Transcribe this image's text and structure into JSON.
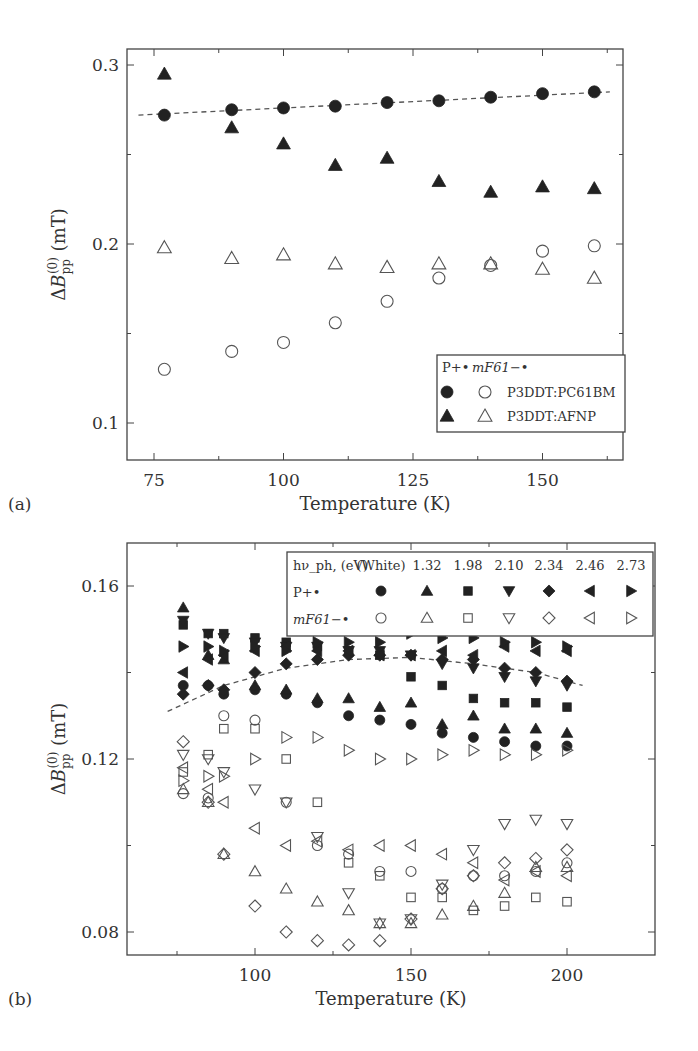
{
  "chart_data": [
    {
      "panel_label": "(a)",
      "type": "scatter",
      "xlabel": "Temperature (K)",
      "ylabel": "ΔB_pp^(0) (mT)",
      "xlim": [
        70,
        165
      ],
      "ylim": [
        0.08,
        0.31
      ],
      "xticks": [
        75,
        100,
        125,
        150
      ],
      "yticks": [
        0.1,
        0.2,
        0.3
      ],
      "grid": false,
      "legend": {
        "position": "lower right",
        "header": [
          "P+•",
          "mF61−•"
        ],
        "entries": [
          {
            "label": "P3DDT:PC61BM",
            "filled": "circle",
            "open": "circle"
          },
          {
            "label": "P3DDT:AFNP",
            "filled": "triangle-up",
            "open": "triangle-up"
          }
        ]
      },
      "fit_line": {
        "style": "dashed",
        "series": "P3DDT:PC61BM P+•",
        "x": [
          72,
          163
        ],
        "y": [
          0.272,
          0.285
        ]
      },
      "series": [
        {
          "name": "P3DDT:PC61BM P+•",
          "marker": "circle",
          "filled": true,
          "x": [
            77,
            90,
            100,
            110,
            120,
            130,
            140,
            150,
            160
          ],
          "y": [
            0.272,
            0.275,
            0.276,
            0.277,
            0.279,
            0.28,
            0.282,
            0.284,
            0.285
          ]
        },
        {
          "name": "P3DDT:PC61BM mF61−•",
          "marker": "circle",
          "filled": false,
          "x": [
            77,
            90,
            100,
            110,
            120,
            130,
            140,
            150,
            160
          ],
          "y": [
            0.13,
            0.14,
            0.145,
            0.156,
            0.168,
            0.181,
            0.188,
            0.196,
            0.199
          ]
        },
        {
          "name": "P3DDT:AFNP P+•",
          "marker": "triangle-up",
          "filled": true,
          "x": [
            77,
            90,
            100,
            110,
            120,
            130,
            140,
            150,
            160
          ],
          "y": [
            0.295,
            0.265,
            0.256,
            0.244,
            0.248,
            0.235,
            0.229,
            0.232,
            0.231
          ]
        },
        {
          "name": "P3DDT:AFNP mF61−•",
          "marker": "triangle-up",
          "filled": false,
          "x": [
            77,
            90,
            100,
            110,
            120,
            130,
            140,
            150,
            160
          ],
          "y": [
            0.198,
            0.192,
            0.194,
            0.189,
            0.187,
            0.189,
            0.189,
            0.186,
            0.181
          ]
        }
      ]
    },
    {
      "panel_label": "(b)",
      "type": "scatter",
      "xlabel": "Temperature (K)",
      "ylabel": "ΔB_pp^(0) (mT)",
      "xlim": [
        65,
        210
      ],
      "ylim": [
        0.075,
        0.166
      ],
      "xticks": [
        100,
        150,
        200
      ],
      "yticks": [
        0.08,
        0.12,
        0.16
      ],
      "grid": false,
      "legend": {
        "position": "upper right",
        "header_label": "hν_ph, (eV)",
        "columns": [
          "(White)",
          "1.32",
          "1.98",
          "2.10",
          "2.34",
          "2.46",
          "2.73"
        ],
        "row_labels": [
          "P+•",
          "mF61−•"
        ],
        "markers": [
          "circle",
          "triangle-up",
          "square",
          "triangle-down",
          "diamond",
          "triangle-left",
          "triangle-right"
        ]
      },
      "fit_line": {
        "style": "dashed",
        "x": [
          72,
          90,
          110,
          130,
          150,
          170,
          190,
          205
        ],
        "y": [
          0.131,
          0.137,
          0.141,
          0.143,
          0.1435,
          0.142,
          0.14,
          0.137
        ]
      },
      "series": [
        {
          "name": "White P+•",
          "marker": "circle",
          "filled": true,
          "x": [
            77,
            85,
            90,
            100,
            110,
            120,
            130,
            140,
            150,
            160,
            170,
            180,
            190,
            200
          ],
          "y": [
            0.137,
            0.137,
            0.135,
            0.136,
            0.135,
            0.133,
            0.13,
            0.129,
            0.128,
            0.126,
            0.125,
            0.124,
            0.123,
            0.123
          ]
        },
        {
          "name": "White mF61−•",
          "marker": "circle",
          "filled": false,
          "x": [
            77,
            85,
            90,
            100,
            110,
            120,
            130,
            140,
            150,
            160,
            170,
            180,
            190,
            200
          ],
          "y": [
            0.112,
            0.111,
            0.13,
            0.129,
            0.11,
            0.1,
            0.098,
            0.094,
            0.094,
            0.09,
            0.093,
            0.093,
            0.094,
            0.096
          ]
        },
        {
          "name": "1.32 P+•",
          "marker": "triangle-up",
          "filled": true,
          "x": [
            77,
            85,
            90,
            100,
            110,
            120,
            130,
            140,
            150,
            160,
            170,
            180,
            190,
            200
          ],
          "y": [
            0.155,
            0.144,
            0.143,
            0.137,
            0.136,
            0.134,
            0.134,
            0.132,
            0.133,
            0.128,
            0.13,
            0.127,
            0.127,
            0.126
          ]
        },
        {
          "name": "1.32 mF61−•",
          "marker": "triangle-up",
          "filled": false,
          "x": [
            77,
            85,
            90,
            100,
            110,
            120,
            130,
            140,
            150,
            160,
            170,
            180,
            190,
            200
          ],
          "y": [
            0.113,
            0.11,
            0.098,
            0.094,
            0.09,
            0.087,
            0.085,
            0.082,
            0.082,
            0.084,
            0.086,
            0.089,
            0.095,
            0.095
          ]
        },
        {
          "name": "1.98 P+•",
          "marker": "square",
          "filled": true,
          "x": [
            77,
            85,
            90,
            100,
            110,
            120,
            130,
            140,
            150,
            160,
            170,
            180,
            190,
            200
          ],
          "y": [
            0.151,
            0.149,
            0.149,
            0.148,
            0.147,
            0.146,
            0.145,
            0.144,
            0.139,
            0.137,
            0.134,
            0.133,
            0.133,
            0.132
          ]
        },
        {
          "name": "1.98 mF61−•",
          "marker": "square",
          "filled": false,
          "x": [
            77,
            85,
            90,
            100,
            110,
            120,
            130,
            140,
            150,
            160,
            170,
            180,
            190,
            200
          ],
          "y": [
            0.117,
            0.121,
            0.127,
            0.127,
            0.12,
            0.11,
            0.096,
            0.093,
            0.088,
            0.088,
            0.085,
            0.086,
            0.088,
            0.087
          ]
        },
        {
          "name": "2.10 P+•",
          "marker": "triangle-down",
          "filled": true,
          "x": [
            77,
            85,
            90,
            100,
            110,
            120,
            130,
            140,
            150,
            160,
            170,
            180,
            190,
            200
          ],
          "y": [
            0.152,
            0.149,
            0.148,
            0.147,
            0.146,
            0.146,
            0.145,
            0.145,
            0.144,
            0.142,
            0.141,
            0.139,
            0.138,
            0.137
          ]
        },
        {
          "name": "2.10 mF61−•",
          "marker": "triangle-down",
          "filled": false,
          "x": [
            77,
            85,
            90,
            100,
            110,
            120,
            130,
            140,
            150,
            160,
            170,
            180,
            190,
            200
          ],
          "y": [
            0.121,
            0.12,
            0.117,
            0.113,
            0.11,
            0.102,
            0.089,
            0.082,
            0.083,
            0.091,
            0.099,
            0.105,
            0.106,
            0.105
          ]
        },
        {
          "name": "2.34 P+•",
          "marker": "diamond",
          "filled": true,
          "x": [
            77,
            85,
            90,
            100,
            110,
            120,
            130,
            140,
            150,
            160,
            170,
            180,
            190,
            200
          ],
          "y": [
            0.135,
            0.137,
            0.136,
            0.14,
            0.142,
            0.143,
            0.144,
            0.144,
            0.144,
            0.143,
            0.143,
            0.141,
            0.14,
            0.138
          ]
        },
        {
          "name": "2.34 mF61−•",
          "marker": "diamond",
          "filled": false,
          "x": [
            77,
            85,
            90,
            100,
            110,
            120,
            130,
            140,
            150,
            160,
            170,
            180,
            190,
            200
          ],
          "y": [
            0.124,
            0.11,
            0.098,
            0.086,
            0.08,
            0.078,
            0.077,
            0.078,
            0.083,
            0.09,
            0.093,
            0.096,
            0.097,
            0.099
          ]
        },
        {
          "name": "2.46 P+•",
          "marker": "triangle-left",
          "filled": true,
          "x": [
            77,
            85,
            90,
            100,
            110,
            120,
            130,
            140,
            150,
            160,
            170,
            180,
            190,
            200
          ],
          "y": [
            0.14,
            0.143,
            0.144,
            0.145,
            0.146,
            0.145,
            0.145,
            0.144,
            0.144,
            0.145,
            0.144,
            0.146,
            0.145,
            0.145
          ]
        },
        {
          "name": "2.46 mF61−•",
          "marker": "triangle-left",
          "filled": false,
          "x": [
            77,
            85,
            90,
            100,
            110,
            120,
            130,
            140,
            150,
            160,
            170,
            180,
            190,
            200
          ],
          "y": [
            0.118,
            0.113,
            0.11,
            0.104,
            0.1,
            0.101,
            0.099,
            0.1,
            0.1,
            0.098,
            0.096,
            0.092,
            0.094,
            0.093
          ]
        },
        {
          "name": "2.73 P+•",
          "marker": "triangle-right",
          "filled": true,
          "x": [
            77,
            85,
            90,
            100,
            110,
            120,
            130,
            140,
            150,
            160,
            170,
            180,
            190,
            200
          ],
          "y": [
            0.146,
            0.146,
            0.145,
            0.146,
            0.145,
            0.147,
            0.147,
            0.147,
            0.149,
            0.148,
            0.148,
            0.147,
            0.147,
            0.146
          ]
        },
        {
          "name": "2.73 mF61−•",
          "marker": "triangle-right",
          "filled": false,
          "x": [
            77,
            85,
            90,
            100,
            110,
            120,
            130,
            140,
            150,
            160,
            170,
            180,
            190,
            200
          ],
          "y": [
            0.115,
            0.116,
            0.116,
            0.12,
            0.125,
            0.125,
            0.122,
            0.12,
            0.12,
            0.121,
            0.122,
            0.121,
            0.121,
            0.122
          ]
        }
      ]
    }
  ]
}
